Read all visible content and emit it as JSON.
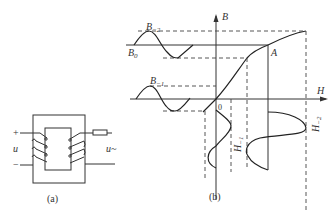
{
  "figure": {
    "panel_a": {
      "caption": "(a)",
      "labels": {
        "plus": "+",
        "minus": "−",
        "u_left": "u",
        "u_right": "u~"
      }
    },
    "panel_b": {
      "caption": "(b)",
      "axis_labels": {
        "y": "B",
        "x": "H",
        "origin": "0"
      },
      "labels": {
        "B_m2": "B",
        "B_m2_sub": "−2",
        "B_0": "B",
        "B_0_sub": "0",
        "B_m1": "B",
        "B_m1_sub": "−1",
        "point_A": "A",
        "H_m1": "H",
        "H_m1_sub": "−1",
        "H_m2": "H",
        "H_m2_sub": "−2"
      }
    }
  }
}
